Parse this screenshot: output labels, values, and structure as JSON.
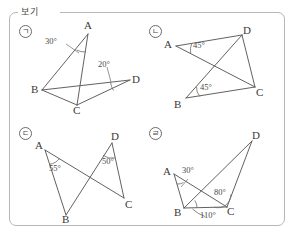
{
  "box": {
    "label": "보기",
    "border_color": "#b9b6b3",
    "background": "#ffffff"
  },
  "figures": [
    {
      "marker": "ㄱ",
      "vertices": [
        {
          "name": "A",
          "label": "A"
        },
        {
          "name": "B",
          "label": "B"
        },
        {
          "name": "C",
          "label": "C"
        },
        {
          "name": "D",
          "label": "D"
        }
      ],
      "angles": [
        {
          "at": "A",
          "label": "30°"
        },
        {
          "at": "D",
          "label": "20°"
        }
      ]
    },
    {
      "marker": "ㄴ",
      "vertices": [
        {
          "name": "A",
          "label": "A"
        },
        {
          "name": "D",
          "label": "D"
        },
        {
          "name": "B",
          "label": "B"
        },
        {
          "name": "C",
          "label": "C"
        }
      ],
      "angles": [
        {
          "at": "A",
          "label": "45°"
        },
        {
          "at": "B",
          "label": "45°"
        }
      ]
    },
    {
      "marker": "ㄷ",
      "vertices": [
        {
          "name": "A",
          "label": "A"
        },
        {
          "name": "D",
          "label": "D"
        },
        {
          "name": "B",
          "label": "B"
        },
        {
          "name": "C",
          "label": "C"
        }
      ],
      "angles": [
        {
          "at": "A",
          "label": "55°"
        },
        {
          "at": "D",
          "label": "50°"
        }
      ]
    },
    {
      "marker": "ㄹ",
      "vertices": [
        {
          "name": "A",
          "label": "A"
        },
        {
          "name": "D",
          "label": "D"
        },
        {
          "name": "B",
          "label": "B"
        },
        {
          "name": "C",
          "label": "C"
        }
      ],
      "angles": [
        {
          "at": "A",
          "label": "30°"
        },
        {
          "at": "C-inner",
          "label": "80°"
        },
        {
          "at": "C-outer",
          "label": "110°"
        }
      ]
    }
  ]
}
